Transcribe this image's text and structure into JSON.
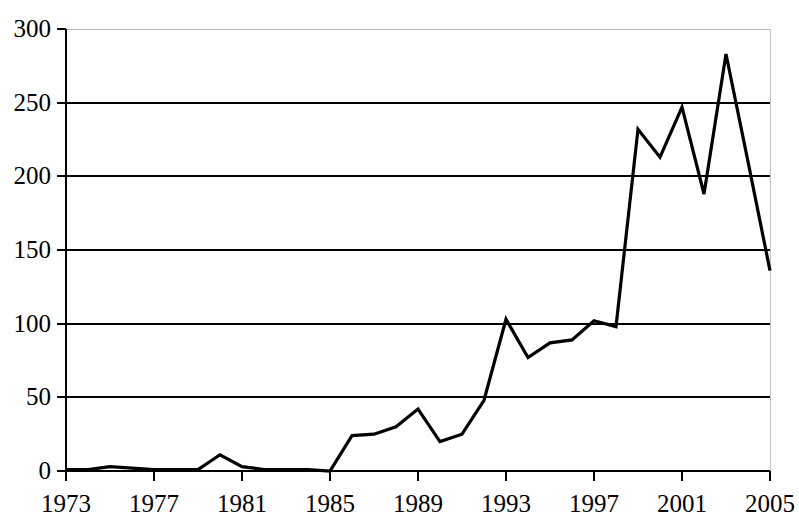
{
  "chart_data": {
    "type": "line",
    "title": "",
    "subtitle": "",
    "xlabel": "",
    "ylabel": "",
    "xlim": [
      1973,
      2005
    ],
    "ylim": [
      0,
      300
    ],
    "grid": "horizontal",
    "legend": "none",
    "series_color": "#000000",
    "background_color": "#ffffff",
    "axis_color": "#000000",
    "grid_color": "#000000",
    "x": [
      1973,
      1974,
      1975,
      1976,
      1977,
      1978,
      1979,
      1980,
      1981,
      1982,
      1983,
      1984,
      1985,
      1986,
      1987,
      1988,
      1989,
      1990,
      1991,
      1992,
      1993,
      1994,
      1995,
      1996,
      1997,
      1998,
      1999,
      2000,
      2001,
      2002,
      2003,
      2004,
      2005
    ],
    "series": [
      {
        "name": "count",
        "values": [
          1,
          1,
          3,
          2,
          1,
          1,
          1,
          11,
          3,
          1,
          1,
          1,
          0,
          24,
          25,
          30,
          42,
          20,
          25,
          48,
          103,
          77,
          87,
          89,
          102,
          98,
          232,
          213,
          247,
          188,
          283,
          210,
          136
        ]
      }
    ],
    "y_ticks": [
      0,
      50,
      100,
      150,
      200,
      250,
      300
    ],
    "y_tick_labels": [
      "0",
      "50",
      "100",
      "150",
      "200",
      "250",
      "300"
    ],
    "x_ticks": [
      1973,
      1977,
      1981,
      1985,
      1989,
      1993,
      1997,
      2001,
      2005
    ],
    "x_tick_labels": [
      "1973",
      "1977",
      "1981",
      "1985",
      "1989",
      "1993",
      "1997",
      "2001",
      "2005"
    ],
    "annotations": []
  },
  "geometry": {
    "plot_left": 66,
    "plot_right": 770,
    "plot_top": 29,
    "plot_bottom": 471,
    "line_width": 3.2
  }
}
